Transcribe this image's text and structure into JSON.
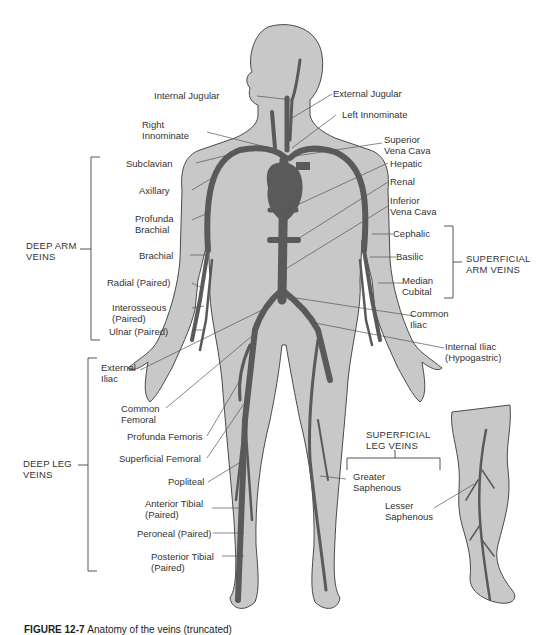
{
  "figure": {
    "colors": {
      "body_fill": "#c8c8c8",
      "body_outline": "#4a4a4a",
      "vein": "#5a5a5a",
      "leader_line": "#555555",
      "text": "#333333",
      "background": "#ffffff"
    }
  },
  "labels": {
    "internal_jugular": "Internal Jugular",
    "external_jugular": "External Jugular",
    "left_innominate": "Left Innominate",
    "right_innominate": "Right\nInnominate",
    "superior_vena_cava": "Superior\nVena Cava",
    "subclavian": "Subclavian",
    "hepatic": "Hepatic",
    "axillary": "Axillary",
    "renal": "Renal",
    "profunda_brachial": "Profunda\nBrachial",
    "inferior_vena_cava": "Inferior\nVena Cava",
    "brachial": "Brachial",
    "cephalic": "Cephalic",
    "basilic": "Basilic",
    "radial": "Radial (Paired)",
    "median_cubital": "Median\nCubital",
    "interosseous": "Interosseous\n(Paired)",
    "ulnar": "Ulnar (Paired)",
    "common_iliac": "Common\nIliac",
    "internal_iliac": "Internal Iliac\n(Hypogastric)",
    "external_iliac": "External\nIliac",
    "common_femoral": "Common\nFemoral",
    "profunda_femoris": "Profunda Femoris",
    "superficial_femoral": "Superficial Femoral",
    "popliteal": "Popliteal",
    "anterior_tibial": "Anterior Tibial\n(Paired)",
    "peroneal": "Peroneal (Paired)",
    "posterior_tibial": "Posterior Tibial\n(Paired)",
    "greater_saphenous": "Greater\nSaphenous",
    "lesser_saphenous": "Lesser\nSaphenous"
  },
  "groups": {
    "deep_arm_veins": "DEEP ARM\nVEINS",
    "superficial_arm_veins": "SUPERFICIAL\nARM VEINS",
    "deep_leg_veins": "DEEP LEG\nVEINS",
    "superficial_leg_veins": "SUPERFICIAL\nLEG VEINS"
  },
  "caption": {
    "number": "FIGURE 12-7",
    "text": "Anatomy of the veins (truncated)"
  }
}
